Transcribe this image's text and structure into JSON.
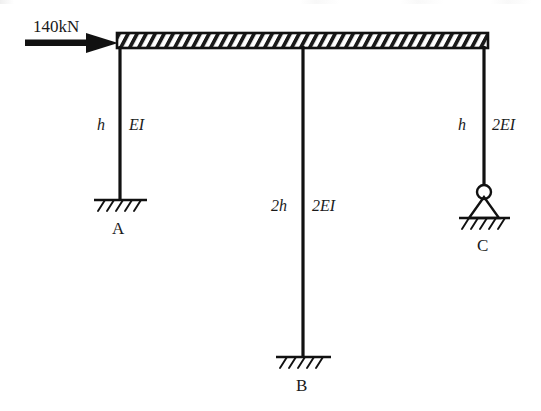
{
  "figure": {
    "type": "structural-frame-diagram",
    "background_color": "#ffffff",
    "line_color": "#1a1a1a"
  },
  "load": {
    "label": "140kN",
    "direction": "right",
    "applied_at": "top-left-joint"
  },
  "members": {
    "beam": {
      "name": "rigid-hatched-beam",
      "x_start": 117,
      "x_end": 488,
      "y_top": 33,
      "y_bottom": 48
    },
    "columns": [
      {
        "name": "left-column",
        "node": "A",
        "height_label": "h",
        "stiffness_label": "EI",
        "x": 120,
        "y_top": 48,
        "y_bottom": 200
      },
      {
        "name": "middle-column",
        "node": "B",
        "height_label": "2h",
        "stiffness_label": "2EI",
        "x": 303,
        "y_top": 48,
        "y_bottom": 357
      },
      {
        "name": "right-column",
        "node": "C",
        "height_label": "h",
        "stiffness_label": "2EI",
        "x": 484,
        "y_top": 48,
        "y_bottom": 188
      }
    ]
  },
  "supports": [
    {
      "name": "support-A",
      "node_label": "A",
      "kind": "fixed",
      "x": 120,
      "y": 200
    },
    {
      "name": "support-B",
      "node_label": "B",
      "kind": "fixed",
      "x": 303,
      "y": 357
    },
    {
      "name": "support-C",
      "node_label": "C",
      "kind": "pinned",
      "x": 484,
      "y": 218
    }
  ],
  "labels": {
    "force": "140kN",
    "left_height": "h",
    "left_stiffness": "EI",
    "middle_height": "2h",
    "middle_stiffness": "2EI",
    "right_height": "h",
    "right_stiffness": "2EI",
    "node_a": "A",
    "node_b": "B",
    "node_c": "C"
  }
}
